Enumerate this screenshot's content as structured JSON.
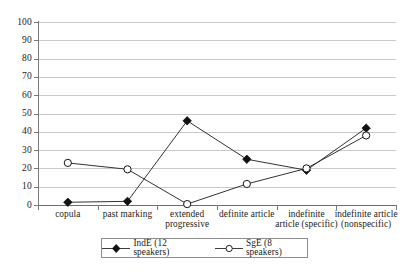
{
  "chart_data": {
    "type": "line",
    "title": "",
    "xlabel": "",
    "ylabel": "",
    "ylim": [
      0,
      100
    ],
    "ytick_step": 10,
    "yticks": [
      100,
      90,
      80,
      70,
      60,
      50,
      40,
      30,
      20,
      10,
      0
    ],
    "grid": true,
    "legend_position": "bottom",
    "categories": [
      "copula",
      "past marking",
      "extended\nprogressive",
      "definite article",
      "indefinite\narticle (specific)",
      "indefinite article\n(nonspecific)"
    ],
    "series": [
      {
        "name": "IndE (12 speakers)",
        "marker": "filled-diamond",
        "color": "#111111",
        "values": [
          1.5,
          2,
          46,
          25,
          19,
          42
        ]
      },
      {
        "name": "SgE (8 speakers)",
        "marker": "open-circle",
        "color": "#111111",
        "values": [
          23,
          19.5,
          0.5,
          11.5,
          20,
          38
        ]
      }
    ]
  },
  "legend": {
    "entries": [
      {
        "label": "IndE (12 speakers)",
        "marker": "filled-diamond"
      },
      {
        "label": "SgE (8 speakers)",
        "marker": "open-circle"
      }
    ]
  },
  "colors": {
    "line": "#333333",
    "grid": "#c9c9c9",
    "axis": "#6e6e6e",
    "text": "#1a1a1a",
    "background": "#ffffff"
  }
}
